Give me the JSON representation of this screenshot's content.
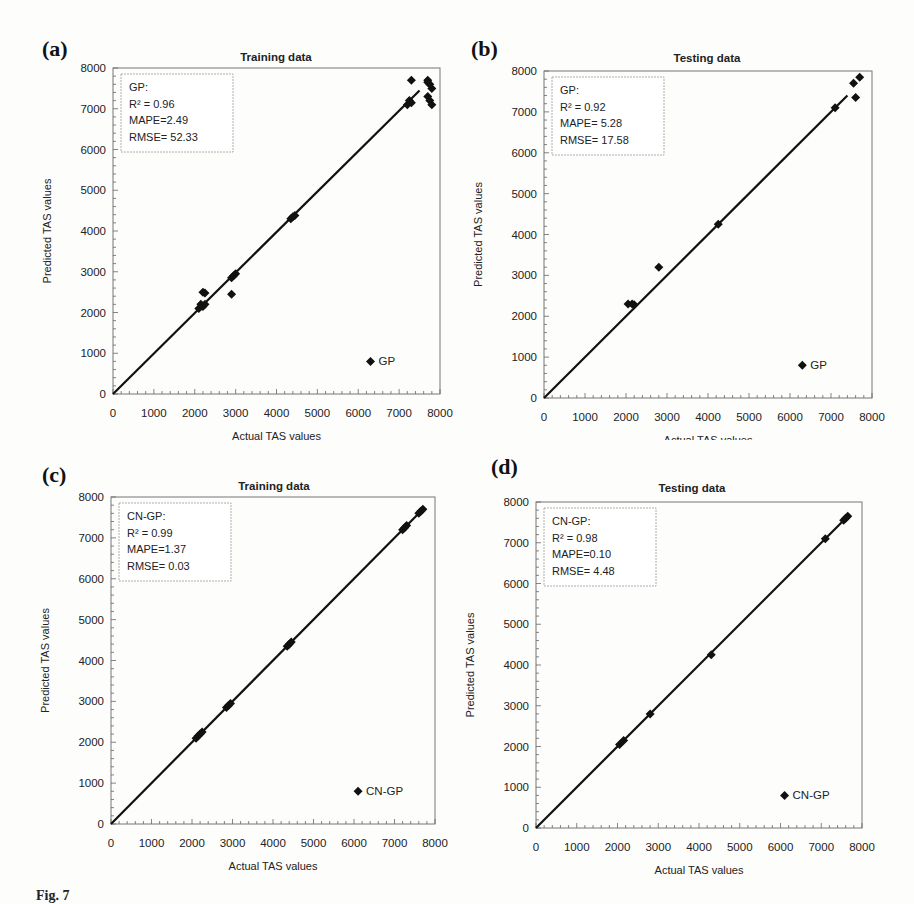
{
  "figure": {
    "caption_fragment": "Fig. 7"
  },
  "chart_data": [
    {
      "id": "a",
      "panel_label": "(a)",
      "type": "scatter",
      "title": "Training data",
      "xlabel": "Actual TAS values",
      "ylabel": "Predicted TAS values",
      "xlim": [
        0,
        8000
      ],
      "ylim": [
        0,
        8000
      ],
      "xticks": [
        0,
        1000,
        2000,
        3000,
        4000,
        5000,
        6000,
        7000,
        8000
      ],
      "yticks": [
        0,
        1000,
        2000,
        3000,
        4000,
        5000,
        6000,
        7000,
        8000
      ],
      "grid": false,
      "legend": {
        "label": "GP",
        "position": "lower right"
      },
      "stats": {
        "model": "GP:",
        "r2": "R² = 0.96",
        "mape": "MAPE=2.49",
        "rmse": "RMSE= 52.33"
      },
      "fit_line": {
        "x0": 0,
        "y0": 0,
        "x1": 7500,
        "y1": 7450
      },
      "series": [
        {
          "name": "GP",
          "points": [
            [
              2100,
              2100
            ],
            [
              2150,
              2200
            ],
            [
              2200,
              2150
            ],
            [
              2250,
              2200
            ],
            [
              2200,
              2500
            ],
            [
              2250,
              2480
            ],
            [
              2900,
              2450
            ],
            [
              2900,
              2850
            ],
            [
              2950,
              2900
            ],
            [
              3000,
              2950
            ],
            [
              4350,
              4300
            ],
            [
              4400,
              4350
            ],
            [
              4450,
              4380
            ],
            [
              7200,
              7100
            ],
            [
              7250,
              7200
            ],
            [
              7300,
              7150
            ],
            [
              7300,
              7700
            ],
            [
              7700,
              7700
            ],
            [
              7750,
              7600
            ],
            [
              7800,
              7500
            ],
            [
              7700,
              7300
            ],
            [
              7750,
              7200
            ],
            [
              7800,
              7100
            ],
            [
              7700,
              7650
            ]
          ]
        }
      ]
    },
    {
      "id": "b",
      "panel_label": "(b)",
      "type": "scatter",
      "title": "Testing data",
      "xlabel": "Actual TAS values",
      "ylabel": "Predicted TAS values",
      "xlim": [
        0,
        8000
      ],
      "ylim": [
        0,
        8000
      ],
      "xticks": [
        0,
        1000,
        2000,
        3000,
        4000,
        5000,
        6000,
        7000,
        8000
      ],
      "yticks": [
        0,
        1000,
        2000,
        3000,
        4000,
        5000,
        6000,
        7000,
        8000
      ],
      "grid": false,
      "legend": {
        "label": "GP",
        "position": "lower right"
      },
      "stats": {
        "model": "GP:",
        "r2": "R² = 0.92",
        "mape": "MAPE= 5.28",
        "rmse": "RMSE= 17.58"
      },
      "fit_line": {
        "x0": 0,
        "y0": 0,
        "x1": 7400,
        "y1": 7400
      },
      "series": [
        {
          "name": "GP",
          "points": [
            [
              2050,
              2300
            ],
            [
              2150,
              2300
            ],
            [
              2200,
              2280
            ],
            [
              2800,
              3200
            ],
            [
              4250,
              4250
            ],
            [
              7100,
              7100
            ],
            [
              7550,
              7700
            ],
            [
              7700,
              7850
            ],
            [
              7600,
              7350
            ]
          ]
        }
      ]
    },
    {
      "id": "c",
      "panel_label": "(c)",
      "type": "scatter",
      "title": "Training data",
      "xlabel": "Actual TAS values",
      "ylabel": "Predicted TAS values",
      "xlim": [
        0,
        8000
      ],
      "ylim": [
        0,
        8000
      ],
      "xticks": [
        0,
        1000,
        2000,
        3000,
        4000,
        5000,
        6000,
        7000,
        8000
      ],
      "yticks": [
        0,
        1000,
        2000,
        3000,
        4000,
        5000,
        6000,
        7000,
        8000
      ],
      "grid": false,
      "legend": {
        "label": "CN-GP",
        "position": "lower right"
      },
      "stats": {
        "model": "CN-GP:",
        "r2": "R² = 0.99",
        "mape": "MAPE=1.37",
        "rmse": "RMSE= 0.03"
      },
      "fit_line": {
        "x0": 0,
        "y0": 0,
        "x1": 7700,
        "y1": 7700
      },
      "series": [
        {
          "name": "CN-GP",
          "points": [
            [
              2100,
              2100
            ],
            [
              2150,
              2150
            ],
            [
              2200,
              2200
            ],
            [
              2250,
              2250
            ],
            [
              2850,
              2850
            ],
            [
              2900,
              2900
            ],
            [
              2950,
              2950
            ],
            [
              4350,
              4350
            ],
            [
              4400,
              4400
            ],
            [
              4450,
              4450
            ],
            [
              7200,
              7200
            ],
            [
              7250,
              7250
            ],
            [
              7300,
              7300
            ],
            [
              7600,
              7600
            ],
            [
              7650,
              7650
            ],
            [
              7700,
              7700
            ]
          ]
        }
      ]
    },
    {
      "id": "d",
      "panel_label": "(d)",
      "type": "scatter",
      "title": "Testing data",
      "xlabel": "Actual TAS values",
      "ylabel": "Predicted TAS values",
      "xlim": [
        0,
        8000
      ],
      "ylim": [
        0,
        8000
      ],
      "xticks": [
        0,
        1000,
        2000,
        3000,
        4000,
        5000,
        6000,
        7000,
        8000
      ],
      "yticks": [
        0,
        1000,
        2000,
        3000,
        4000,
        5000,
        6000,
        7000,
        8000
      ],
      "grid": false,
      "legend": {
        "label": "CN-GP",
        "position": "lower right"
      },
      "stats": {
        "model": "CN-GP:",
        "r2": "R² = 0.98",
        "mape": "MAPE=0.10",
        "rmse": "RMSE= 4.48"
      },
      "fit_line": {
        "x0": 0,
        "y0": 0,
        "x1": 7700,
        "y1": 7700
      },
      "series": [
        {
          "name": "CN-GP",
          "points": [
            [
              2050,
              2050
            ],
            [
              2150,
              2150
            ],
            [
              2800,
              2800
            ],
            [
              4300,
              4250
            ],
            [
              7100,
              7100
            ],
            [
              7550,
              7550
            ],
            [
              7600,
              7600
            ],
            [
              7650,
              7650
            ]
          ]
        }
      ]
    }
  ]
}
